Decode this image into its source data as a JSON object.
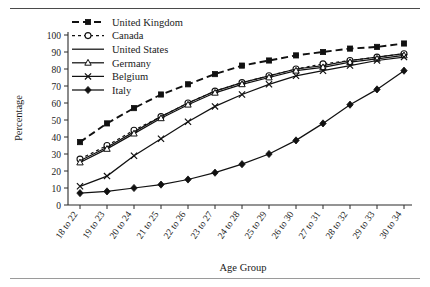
{
  "figure": {
    "top_rule": true,
    "bottom_rule": true
  },
  "chart_data": {
    "type": "line",
    "title": "",
    "xlabel": "Age Group",
    "ylabel": "Percentage",
    "ylim": [
      0,
      100
    ],
    "ytick_step": 10,
    "yticks": [
      0,
      10,
      20,
      30,
      40,
      50,
      60,
      70,
      80,
      90,
      100
    ],
    "grid": false,
    "legend_position": "top-left",
    "categories": [
      "18 to 22",
      "19 to 23",
      "20 to 24",
      "21 to 25",
      "22 to 26",
      "23 to 27",
      "24 to 28",
      "25 to 29",
      "26 to 30",
      "27 to 31",
      "28 to 32",
      "29 to 33",
      "30 to 34"
    ],
    "series": [
      {
        "name": "United Kingdom",
        "marker": "filled-square",
        "line": "dashed",
        "values": [
          37,
          48,
          57,
          65,
          71,
          77,
          82,
          85,
          88,
          90,
          92,
          93,
          95
        ]
      },
      {
        "name": "Canada",
        "marker": "open-circle",
        "line": "dotted",
        "values": [
          27,
          35,
          44,
          52,
          60,
          67,
          72,
          76,
          80,
          83,
          85,
          87,
          89
        ]
      },
      {
        "name": "United States",
        "marker": "none",
        "line": "solid",
        "values": [
          26,
          34,
          43,
          52,
          60,
          67,
          72,
          76,
          80,
          82,
          85,
          87,
          89
        ]
      },
      {
        "name": "Germany",
        "marker": "open-triangle",
        "line": "solid",
        "values": [
          25,
          33,
          42,
          51,
          59,
          66,
          71,
          75,
          79,
          81,
          84,
          86,
          88
        ]
      },
      {
        "name": "Belgium",
        "marker": "cross",
        "line": "solid",
        "values": [
          11,
          17,
          29,
          39,
          49,
          58,
          65,
          71,
          76,
          79,
          82,
          85,
          87
        ]
      },
      {
        "name": "Italy",
        "marker": "filled-diamond",
        "line": "solid",
        "values": [
          7,
          8,
          10,
          12,
          15,
          19,
          24,
          30,
          38,
          48,
          59,
          68,
          79
        ]
      }
    ]
  },
  "axes": {
    "y_axis_label": "Percentage",
    "x_axis_label": "Age Group"
  },
  "colors": {
    "ink": "#1a1a1a",
    "axis": "#2b2b2b",
    "rule": "#4a4a4a",
    "background": "#ffffff"
  }
}
